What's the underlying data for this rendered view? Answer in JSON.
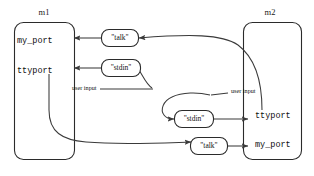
{
  "diagram": {
    "title": "",
    "modules": [
      {
        "id": "m1",
        "label": "m1",
        "ports": [
          {
            "id": "m1-my-port",
            "label": "my_port"
          },
          {
            "id": "m1-ttyport",
            "label": "ttyport"
          }
        ]
      },
      {
        "id": "m2",
        "label": "m2",
        "ports": [
          {
            "id": "m2-ttyport",
            "label": "ttyport"
          },
          {
            "id": "m2-my-port",
            "label": "my_port"
          }
        ]
      }
    ],
    "bubbles": [
      {
        "id": "bubble-talk-top",
        "label": "\"talk\""
      },
      {
        "id": "bubble-stdin-top",
        "label": "\"stdin\""
      },
      {
        "id": "bubble-stdin-bottom",
        "label": "\"stdin\""
      },
      {
        "id": "bubble-talk-bottom",
        "label": "\"talk\""
      }
    ],
    "edge_labels": [
      {
        "id": "user-input-left",
        "label": "user input"
      },
      {
        "id": "user-input-right",
        "label": "user input"
      }
    ],
    "colors": {
      "stroke": "#2b2b2b",
      "connector": "#3a3a3a",
      "text": "#111111",
      "background": "#ffffff"
    }
  }
}
